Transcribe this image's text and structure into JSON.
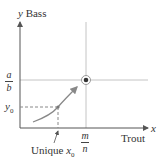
{
  "diagram": {
    "y_axis": {
      "var": "y",
      "label": "Bass"
    },
    "x_axis": {
      "var": "x",
      "label": "Trout"
    },
    "y_ticks": [
      {
        "numerator": "a",
        "denominator": "b"
      },
      {
        "text": "y0",
        "base": "y",
        "sub": "0"
      }
    ],
    "x_ticks": [
      {
        "numerator": "m",
        "denominator": "n"
      }
    ],
    "annotation": {
      "text": "Unique ",
      "var": "x",
      "sub": "0"
    },
    "equilibrium_point": {
      "x_label": "m/n",
      "y_label": "a/b",
      "marker": "circled-dot"
    },
    "colors": {
      "axis": "#555555",
      "guide": "#bbbbbb",
      "curve": "#888888",
      "dash": "#888888",
      "point": "#333333"
    }
  }
}
